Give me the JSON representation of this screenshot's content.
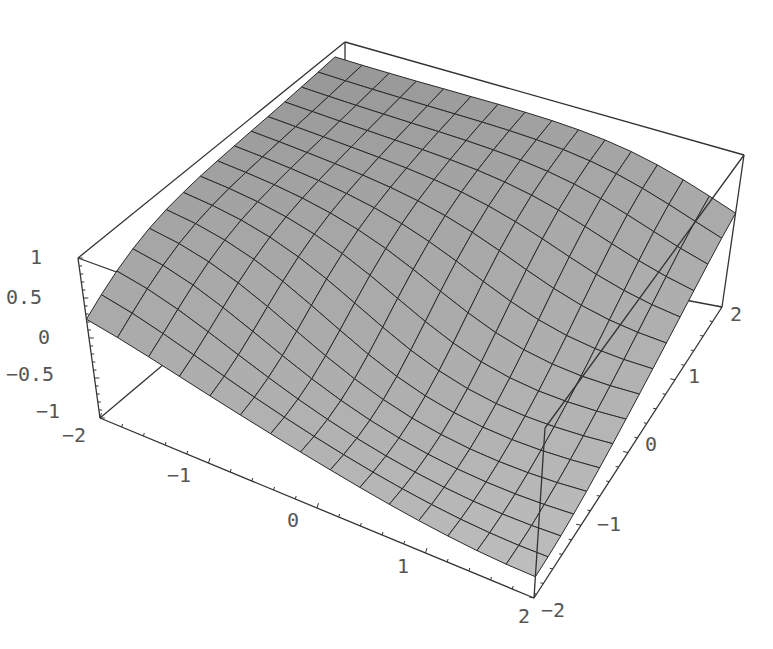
{
  "chart_data": {
    "type": "surface3d",
    "title": "",
    "xlabel": "",
    "ylabel": "",
    "zlabel": "",
    "function_description": "smooth saddle-like surface rising from low at the front-left to high at the back, with grid mesh 15x15",
    "x_range": [
      -2,
      2
    ],
    "y_range": [
      -2,
      2
    ],
    "z_range": [
      -1,
      1
    ],
    "mesh": {
      "nx": 15,
      "ny": 15
    },
    "x_ticks": [
      "-2",
      "-1",
      "0",
      "1",
      "2"
    ],
    "y_ticks": [
      "-2",
      "-1",
      "0",
      "1",
      "2"
    ],
    "z_ticks": [
      "1",
      "0.5",
      "0",
      "-0.5",
      "-1"
    ],
    "surface_color": "#a9a9a9",
    "mesh_color": "#2a2a2a",
    "box": true,
    "grid": false,
    "legend": null
  },
  "axes": {
    "z_labels": [
      {
        "text": "1",
        "x": 30,
        "y": 264
      },
      {
        "text": "0.5",
        "x": 6,
        "y": 304
      },
      {
        "text": "0",
        "x": 38,
        "y": 344
      },
      {
        "text": "-0.5",
        "x": 6,
        "y": 381
      },
      {
        "text": "-1",
        "x": 36,
        "y": 418
      }
    ],
    "x_labels": [
      {
        "text": "-2",
        "x": 62,
        "y": 442
      },
      {
        "text": "-1",
        "x": 167,
        "y": 482
      },
      {
        "text": "0",
        "x": 287,
        "y": 527
      },
      {
        "text": "1",
        "x": 397,
        "y": 573
      },
      {
        "text": "2",
        "x": 518,
        "y": 623
      }
    ],
    "y_labels": [
      {
        "text": "-2",
        "x": 541,
        "y": 617
      },
      {
        "text": "-1",
        "x": 597,
        "y": 531
      },
      {
        "text": "0",
        "x": 645,
        "y": 451
      },
      {
        "text": "1",
        "x": 688,
        "y": 383
      },
      {
        "text": "2",
        "x": 730,
        "y": 321
      }
    ]
  }
}
